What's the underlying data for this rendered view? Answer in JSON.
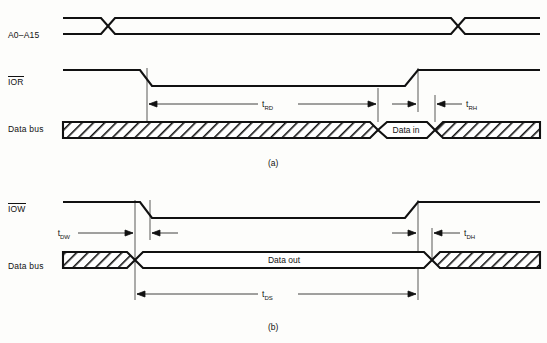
{
  "figure": {
    "type": "timing-diagram",
    "title": "",
    "panels": [
      {
        "caption": "(a)",
        "kind": "io-read-cycle",
        "signals": [
          {
            "name": "A0–A15",
            "label": "A0–A15",
            "overline": false,
            "style": "bus",
            "transitions_px": [
              108,
              458
            ]
          },
          {
            "name": "IOR",
            "label": "IOR",
            "overline": true,
            "style": "active-low-strobe",
            "falling_edge_px": 140,
            "rising_edge_px": 412
          },
          {
            "name": "Data bus",
            "label": "Data bus",
            "overline": false,
            "style": "bus-hatched",
            "valid_window_label": "Data in",
            "valid_window_px": [
              378,
              435
            ]
          }
        ],
        "timing_marks": [
          {
            "name": "tRD",
            "base": "t",
            "sub": "RD",
            "from_px": 147,
            "to_px": 378
          },
          {
            "name": "tRH",
            "base": "t",
            "sub": "RH",
            "from_px": 435,
            "to_px": 470
          }
        ]
      },
      {
        "caption": "(b)",
        "kind": "io-write-cycle",
        "signals": [
          {
            "name": "IOW",
            "label": "IOW",
            "overline": true,
            "style": "active-low-strobe",
            "falling_edge_px": 150,
            "rising_edge_px": 412
          },
          {
            "name": "Data bus",
            "label": "Data bus",
            "overline": false,
            "style": "bus-hatched",
            "valid_window_label": "Data out",
            "valid_window_px": [
              135,
              432
            ]
          }
        ],
        "timing_marks": [
          {
            "name": "tDW",
            "base": "t",
            "sub": "DW",
            "from_px": 78,
            "to_px": 135
          },
          {
            "name": "tDH",
            "base": "t",
            "sub": "DH",
            "from_px": 432,
            "to_px": 470
          },
          {
            "name": "tDS",
            "base": "t",
            "sub": "DS",
            "from_px": 135,
            "to_px": 418
          }
        ]
      }
    ],
    "colors": {
      "ink": "#111111",
      "paper": "#fdfdfb",
      "rule": "#111111"
    }
  }
}
